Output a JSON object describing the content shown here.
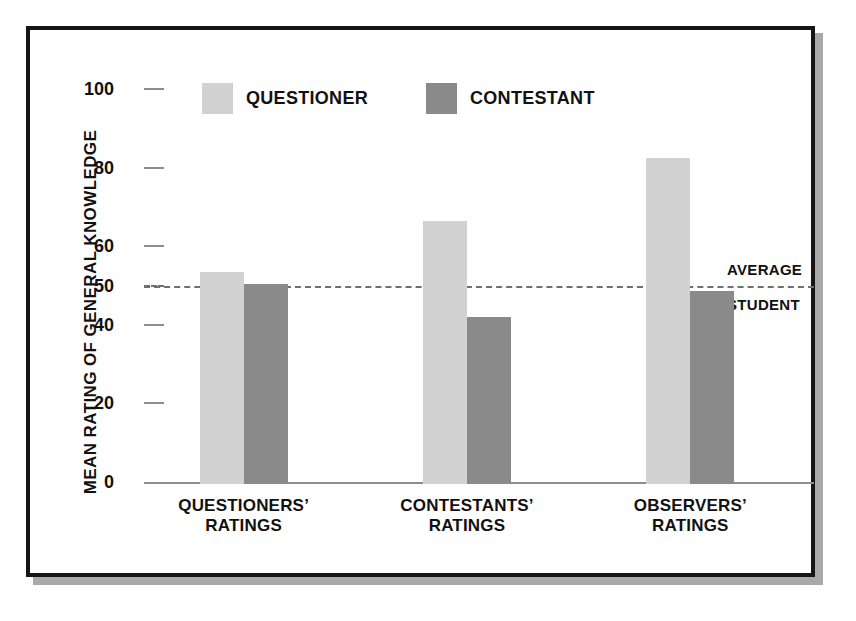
{
  "chart_data": {
    "type": "bar",
    "title": "",
    "subtitle": "",
    "xlabel": "",
    "ylabel": "MEAN RATING OF GENERAL KNOWLEDGE",
    "ylim": [
      0,
      100
    ],
    "yticks": [
      0,
      20,
      40,
      50,
      60,
      80,
      100
    ],
    "ytick_labels": [
      "0",
      "20",
      "40",
      "50",
      "60",
      "80",
      "100"
    ],
    "grid": false,
    "legend_position": "top-center",
    "categories": [
      "QUESTIONERS’ RATINGS",
      "CONTESTANTS’ RATINGS",
      "OBSERVERS’ RATINGS"
    ],
    "category_lines": [
      [
        "QUESTIONERS’",
        "RATINGS"
      ],
      [
        "CONTESTANTS’",
        "RATINGS"
      ],
      [
        "OBSERVERS’",
        "RATINGS"
      ]
    ],
    "series": [
      {
        "name": "QUESTIONER",
        "color": "#d2d2d2",
        "values": [
          54,
          67,
          83
        ]
      },
      {
        "name": "CONTESTANT",
        "color": "#8a8a8a",
        "values": [
          51,
          42.5,
          49
        ]
      }
    ],
    "annotations": [
      {
        "type": "reference-line",
        "value": 50,
        "style": "dashed",
        "color": "#6f6f6f",
        "label_lines": [
          "AVERAGE",
          "STUDENT"
        ]
      }
    ]
  },
  "legend": {
    "items": [
      {
        "label": "QUESTIONER",
        "color": "#d2d2d2"
      },
      {
        "label": "CONTESTANT",
        "color": "#8a8a8a"
      }
    ]
  },
  "axis": {
    "y_title": "MEAN RATING OF GENERAL KNOWLEDGE",
    "ticks": [
      {
        "label": "100",
        "value": 100
      },
      {
        "label": "80",
        "value": 80
      },
      {
        "label": "60",
        "value": 60
      },
      {
        "label": "50",
        "value": 50
      },
      {
        "label": "40",
        "value": 40
      },
      {
        "label": "20",
        "value": 20
      },
      {
        "label": "0",
        "value": 0
      }
    ]
  },
  "reference": {
    "line1": "AVERAGE",
    "line2": "STUDENT"
  },
  "colors": {
    "questioner": "#d2d2d2",
    "contestant": "#8a8a8a",
    "frame": "#151515",
    "shadow": "#a9a9a9",
    "axis": "#8d8d8d",
    "text": "#111111",
    "background": "#ffffff"
  }
}
